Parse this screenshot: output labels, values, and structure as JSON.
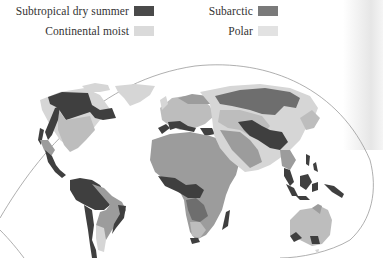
{
  "legend": {
    "items": [
      {
        "label": "Subtropical dry summer",
        "color": "#4a4a4a"
      },
      {
        "label": "Continental moist",
        "color": "#dadada"
      },
      {
        "label": "Subarctic",
        "color": "#7a7a7a"
      },
      {
        "label": "Polar",
        "color": "#e2e2e2"
      }
    ]
  },
  "map": {
    "title": "World climate regions",
    "palette": {
      "ocean": "#ffffff",
      "outline": "#9a9a9a",
      "dark": "#3f3f3f",
      "mid_dark": "#6e6e6e",
      "mid": "#9c9c9c",
      "light": "#bdbdbd",
      "pale": "#d6d6d6"
    },
    "regions": [
      "North America",
      "Greenland",
      "South America",
      "Europe",
      "Africa",
      "Asia",
      "Southeast Asia",
      "Australia"
    ]
  }
}
